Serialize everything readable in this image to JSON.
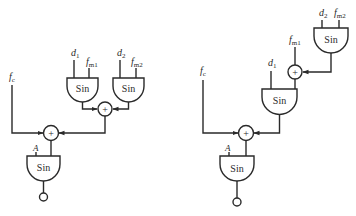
{
  "diagram": {
    "left": {
      "name": "parallel-modulation",
      "blocks": {
        "sin_mod1": {
          "label": "Sin",
          "inputs": [
            "d1",
            "fm1"
          ]
        },
        "sin_mod2": {
          "label": "Sin",
          "inputs": [
            "d2",
            "fm2"
          ]
        },
        "adder_mod": {
          "symbol": "+"
        },
        "adder_carrier": {
          "symbol": "+"
        },
        "sin_carrier": {
          "label": "Sin",
          "amp_input": "A"
        }
      },
      "labels": {
        "d1": "d",
        "d1_sub": "1",
        "fm1": "f",
        "fm1_sub": "m1",
        "d2": "d",
        "d2_sub": "2",
        "fm2": "f",
        "fm2_sub": "m2",
        "fc": "f",
        "fc_sub": "c",
        "A": "A"
      }
    },
    "right": {
      "name": "cascade-modulation",
      "blocks": {
        "sin_mod2": {
          "label": "Sin",
          "inputs": [
            "d2",
            "fm2"
          ]
        },
        "adder_mod": {
          "symbol": "+"
        },
        "sin_mod1": {
          "label": "Sin",
          "inputs": [
            "d1",
            "fm1"
          ]
        },
        "adder_carrier": {
          "symbol": "+"
        },
        "sin_carrier": {
          "label": "Sin",
          "amp_input": "A"
        }
      },
      "labels": {
        "d1": "d",
        "d1_sub": "1",
        "fm1": "f",
        "fm1_sub": "m1",
        "d2": "d",
        "d2_sub": "2",
        "fm2": "f",
        "fm2_sub": "m2",
        "fc": "f",
        "fc_sub": "c",
        "A": "A"
      }
    },
    "sin_label": "Sin",
    "plus": "+"
  }
}
